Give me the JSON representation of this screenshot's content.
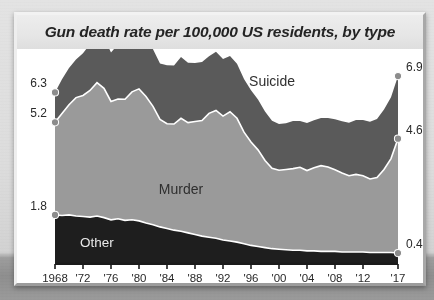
{
  "card": {
    "title": "Gun death rate per 100,000 US residents, by type"
  },
  "colors": {
    "suicide": "#5a5a5a",
    "murder": "#9a9a9a",
    "other": "#1e1e1e",
    "boundary": "#ffffff",
    "axis": "#1a1a1a",
    "label_text": "#2a2a2a",
    "dot": "#8c8c8c",
    "title_band": "#e8e8e8",
    "plot_bg": "#ffffff"
  },
  "chart_data": {
    "type": "area",
    "stacked": true,
    "title": "Gun death rate per 100,000 US residents, by type",
    "xlabel": "",
    "ylabel": "",
    "grid": false,
    "legend": "inline-labels",
    "xlim": [
      1968,
      2017
    ],
    "ylim": [
      0,
      7.6
    ],
    "x": [
      1968,
      1969,
      1970,
      1971,
      1972,
      1973,
      1974,
      1975,
      1976,
      1977,
      1978,
      1979,
      1980,
      1981,
      1982,
      1983,
      1984,
      1985,
      1986,
      1987,
      1988,
      1989,
      1990,
      1991,
      1992,
      1993,
      1994,
      1995,
      1996,
      1997,
      1998,
      1999,
      2000,
      2001,
      2002,
      2003,
      2004,
      2005,
      2006,
      2007,
      2008,
      2009,
      2010,
      2011,
      2012,
      2013,
      2014,
      2015,
      2016,
      2017
    ],
    "tick_labels": [
      "1968",
      "'72",
      "'76",
      "'80",
      "'84",
      "'88",
      "'92",
      "'96",
      "'00",
      "'04",
      "'08",
      "'12",
      "'17"
    ],
    "tick_years": [
      1968,
      1972,
      1976,
      1980,
      1984,
      1988,
      1992,
      1996,
      2000,
      2004,
      2008,
      2012,
      2017
    ],
    "series": [
      {
        "name": "Other",
        "color": "#1e1e1e",
        "inline_label": "Other",
        "start_value": 1.8,
        "end_value": 0.4,
        "values": [
          1.8,
          1.78,
          1.8,
          1.76,
          1.74,
          1.72,
          1.76,
          1.7,
          1.62,
          1.66,
          1.6,
          1.62,
          1.58,
          1.5,
          1.44,
          1.36,
          1.3,
          1.24,
          1.2,
          1.14,
          1.08,
          1.02,
          0.98,
          0.94,
          0.88,
          0.84,
          0.8,
          0.74,
          0.68,
          0.64,
          0.6,
          0.56,
          0.54,
          0.52,
          0.5,
          0.5,
          0.48,
          0.48,
          0.46,
          0.46,
          0.46,
          0.44,
          0.44,
          0.44,
          0.44,
          0.42,
          0.42,
          0.42,
          0.42,
          0.4
        ]
      },
      {
        "name": "Murder",
        "color": "#9a9a9a",
        "inline_label": "Murder",
        "start_value": 3.4,
        "end_value": 4.2,
        "values": [
          3.4,
          3.75,
          4.05,
          4.35,
          4.45,
          4.65,
          4.9,
          4.75,
          4.35,
          4.4,
          4.45,
          4.7,
          4.85,
          4.65,
          4.35,
          3.95,
          3.85,
          3.9,
          4.15,
          4.05,
          4.15,
          4.25,
          4.55,
          4.7,
          4.55,
          4.75,
          4.55,
          4.1,
          3.8,
          3.55,
          3.2,
          2.95,
          2.9,
          2.95,
          3.0,
          3.05,
          2.95,
          3.05,
          3.15,
          3.1,
          3.0,
          2.9,
          2.8,
          2.85,
          2.8,
          2.7,
          2.75,
          3.05,
          3.45,
          4.2
        ]
      },
      {
        "name": "Suicide",
        "color": "#5a5a5a",
        "inline_label": "Suicide",
        "start_value": 1.1,
        "end_value": 2.3,
        "values": [
          1.1,
          1.25,
          1.35,
          1.4,
          1.55,
          1.7,
          1.6,
          1.85,
          1.8,
          2.0,
          1.95,
          1.95,
          1.9,
          2.05,
          2.1,
          2.05,
          2.15,
          2.15,
          2.25,
          2.2,
          2.15,
          2.15,
          2.1,
          2.15,
          2.1,
          2.05,
          2.0,
          1.95,
          1.9,
          1.85,
          1.8,
          1.75,
          1.7,
          1.7,
          1.75,
          1.7,
          1.75,
          1.75,
          1.75,
          1.8,
          1.85,
          1.9,
          1.95,
          2.0,
          2.05,
          2.1,
          2.15,
          2.2,
          2.25,
          2.3
        ]
      }
    ],
    "endpoint_labels": {
      "left": [
        {
          "value": "6.3",
          "meaning": "total 1968",
          "y_value": 6.3
        },
        {
          "value": "5.2",
          "meaning": "murder + other 1968",
          "y_value": 5.2
        },
        {
          "value": "1.8",
          "meaning": "other 1968",
          "y_value": 1.8
        }
      ],
      "right": [
        {
          "value": "6.9",
          "meaning": "total 2017",
          "y_value": 6.9
        },
        {
          "value": "4.6",
          "meaning": "murder + other 2017",
          "y_value": 4.6
        },
        {
          "value": "0.4",
          "meaning": "other 2017",
          "y_value": 0.4
        }
      ]
    }
  }
}
